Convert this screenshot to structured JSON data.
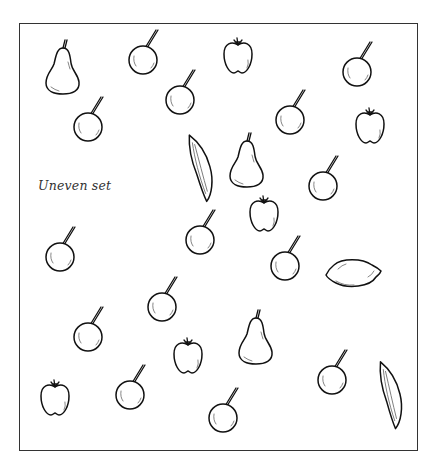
{
  "label": "Uneven set",
  "colors": {
    "ink": "#111111",
    "frame": "#333333",
    "background": "#ffffff"
  },
  "fruits": [
    {
      "type": "pear",
      "x": 63,
      "y": 70,
      "rot": 0
    },
    {
      "type": "cherry",
      "x": 143,
      "y": 60,
      "rot": 0
    },
    {
      "type": "apple",
      "x": 238,
      "y": 58,
      "rot": 0
    },
    {
      "type": "cherry",
      "x": 357,
      "y": 72,
      "rot": 0
    },
    {
      "type": "cherry",
      "x": 180,
      "y": 100,
      "rot": 0
    },
    {
      "type": "cherry",
      "x": 88,
      "y": 127,
      "rot": 0
    },
    {
      "type": "cherry",
      "x": 290,
      "y": 120,
      "rot": 0
    },
    {
      "type": "apple",
      "x": 370,
      "y": 128,
      "rot": 0
    },
    {
      "type": "pod",
      "x": 200,
      "y": 168,
      "rot": -8
    },
    {
      "type": "pear",
      "x": 247,
      "y": 163,
      "rot": 0
    },
    {
      "type": "cherry",
      "x": 323,
      "y": 186,
      "rot": 0
    },
    {
      "type": "apple",
      "x": 264,
      "y": 216,
      "rot": 0
    },
    {
      "type": "cherry",
      "x": 200,
      "y": 240,
      "rot": 0
    },
    {
      "type": "cherry",
      "x": 60,
      "y": 257,
      "rot": 0
    },
    {
      "type": "cherry",
      "x": 285,
      "y": 266,
      "rot": 0
    },
    {
      "type": "lemon",
      "x": 354,
      "y": 273,
      "rot": 0
    },
    {
      "type": "cherry",
      "x": 162,
      "y": 307,
      "rot": 0
    },
    {
      "type": "cherry",
      "x": 88,
      "y": 337,
      "rot": 0
    },
    {
      "type": "pear",
      "x": 256,
      "y": 340,
      "rot": 0
    },
    {
      "type": "apple",
      "x": 188,
      "y": 358,
      "rot": 0
    },
    {
      "type": "cherry",
      "x": 332,
      "y": 380,
      "rot": 0
    },
    {
      "type": "pod",
      "x": 390,
      "y": 395,
      "rot": -6
    },
    {
      "type": "apple",
      "x": 55,
      "y": 400,
      "rot": 0
    },
    {
      "type": "cherry",
      "x": 130,
      "y": 395,
      "rot": 0
    },
    {
      "type": "cherry",
      "x": 223,
      "y": 418,
      "rot": 0
    }
  ]
}
